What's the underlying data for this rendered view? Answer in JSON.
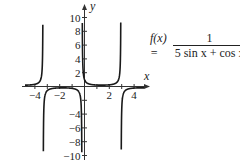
{
  "chart_data": {
    "type": "line",
    "title": "",
    "function_label": "f(x) =",
    "function_expression": "1 / (5 sin x + cos x)",
    "formula": {
      "lhs": "f(x) =",
      "numerator": "1",
      "denominator": "5 sin x + cos x"
    },
    "xlabel": "x",
    "ylabel": "y",
    "xlim": [
      -4.8,
      4.8
    ],
    "ylim": [
      -10,
      10
    ],
    "x_ticks": [
      -4,
      -2,
      2,
      4
    ],
    "x_tick_labels": [
      "−4",
      "−2",
      "2",
      "4"
    ],
    "y_ticks": [
      10,
      8,
      6,
      4,
      2,
      -4,
      -6,
      -8,
      -10
    ],
    "y_tick_labels": [
      "10",
      "8",
      "6",
      "4",
      "2",
      "−4",
      "−6",
      "−8",
      "−10"
    ],
    "grid": false,
    "legend": "none",
    "vertical_asymptotes": [
      -3.339,
      -0.197,
      2.944
    ],
    "local_extrema": [
      {
        "x": -1.768,
        "y": -0.196
      },
      {
        "x": 1.373,
        "y": 0.196
      },
      {
        "x": 4.515,
        "y": -0.196
      },
      {
        "x": -4.91,
        "y": 0.196
      }
    ],
    "series": [
      {
        "name": "f(x)",
        "color": "#1a1a1a",
        "sample_note": "y = 1/(5 sin x + cos x), clipped to [-10, 10]"
      }
    ]
  }
}
